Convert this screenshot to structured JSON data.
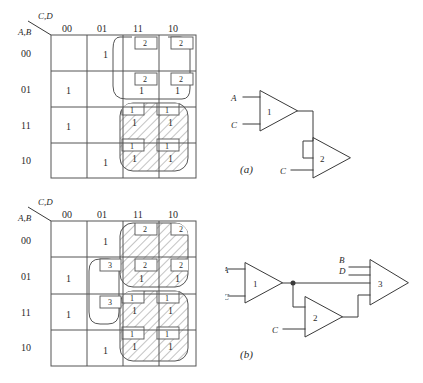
{
  "figure": {
    "axis_top_label": "C,D",
    "axis_left_label": "A,B",
    "column_headers": [
      "00",
      "01",
      "11",
      "10"
    ],
    "row_headers": [
      "00",
      "01",
      "11",
      "10"
    ]
  },
  "kmap_a": {
    "name": "kmap-a",
    "cells": [
      [
        "",
        "1",
        "",
        ""
      ],
      [
        "1",
        "",
        "1",
        "1"
      ],
      [
        "1",
        "",
        "1",
        "1"
      ],
      [
        "",
        "1",
        "1",
        "1"
      ]
    ],
    "tags": [
      [
        "",
        "",
        "2",
        "2"
      ],
      [
        "",
        "",
        "2",
        "2"
      ],
      [
        "",
        "",
        "1",
        "1"
      ],
      [
        "",
        "",
        "1",
        "1"
      ]
    ],
    "groups": [
      {
        "label": "2",
        "style": "plain",
        "cols": [
          2,
          3
        ],
        "rows": [
          0,
          1
        ]
      },
      {
        "label": "1",
        "style": "hatched",
        "cols": [
          2,
          3
        ],
        "rows": [
          2,
          3
        ]
      }
    ]
  },
  "kmap_b": {
    "name": "kmap-b",
    "cells": [
      [
        "",
        "1",
        "",
        ""
      ],
      [
        "1",
        "",
        "1",
        "1"
      ],
      [
        "1",
        "",
        "1",
        "1"
      ],
      [
        "",
        "1",
        "1",
        "1"
      ]
    ],
    "tags": [
      [
        "",
        "",
        "2",
        "2"
      ],
      [
        "",
        "3",
        "2",
        "2"
      ],
      [
        "",
        "3",
        "1",
        "1"
      ],
      [
        "",
        "",
        "1",
        "1"
      ]
    ],
    "groups": [
      {
        "label": "2",
        "style": "hatched",
        "cols": [
          2,
          3
        ],
        "rows": [
          0,
          1
        ]
      },
      {
        "label": "1",
        "style": "hatched",
        "cols": [
          2,
          3
        ],
        "rows": [
          2,
          3
        ]
      },
      {
        "label": "3",
        "style": "plain",
        "cols": [
          1,
          1
        ],
        "rows": [
          1,
          2
        ]
      }
    ]
  },
  "circuit_a": {
    "caption": "(a)",
    "gates": [
      {
        "id": "1",
        "inputs": [
          "A",
          "C"
        ]
      },
      {
        "id": "2",
        "inputs": [
          "C"
        ]
      }
    ]
  },
  "circuit_b": {
    "caption": "(b)",
    "gates": [
      {
        "id": "1",
        "inputs": [
          "A",
          "C"
        ]
      },
      {
        "id": "2",
        "inputs": [
          "C"
        ]
      },
      {
        "id": "3",
        "inputs": [
          "B",
          "D"
        ]
      }
    ]
  },
  "colors": {
    "line": "#3a3a3a",
    "grid": "#555555",
    "hatch": "#777777",
    "text": "#2a2a2a",
    "background": "#ffffff"
  }
}
